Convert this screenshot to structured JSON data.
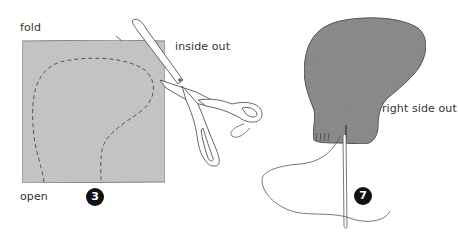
{
  "step3": {
    "label_fold": "fold",
    "label_inside_out": "inside out",
    "label_open": "open",
    "step_number": "3"
  },
  "step7": {
    "label_right_side_out": "right side out",
    "step_number": "7"
  },
  "colors": {
    "fabric_light": "#c9c9c9",
    "fabric_dark": "#8e8e8e",
    "badge": "#111111",
    "line": "#555555"
  }
}
